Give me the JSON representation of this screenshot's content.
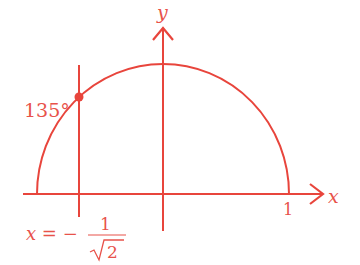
{
  "diagram": {
    "color": "#e8453c",
    "axes": {
      "x_label": "x",
      "y_label": "y",
      "tick_1_label": "1"
    },
    "semicircle": {
      "description": "upper unit semicircle"
    },
    "angle_label": "135°",
    "vertical_line": {
      "equation_prefix": "x = −",
      "numerator": "1",
      "denominator": "2",
      "radical_symbol": "√"
    },
    "point": {
      "description": "intersection at 135°"
    }
  }
}
